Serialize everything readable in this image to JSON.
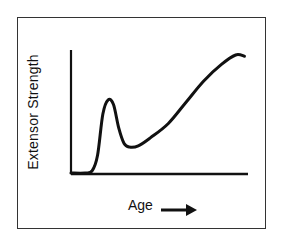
{
  "chart_data": {
    "type": "line",
    "title": "",
    "xlabel": "Age",
    "ylabel": "Extensor Strength",
    "x_arrow": true,
    "grid": false,
    "legend": null,
    "x_ticks": [],
    "y_ticks": [],
    "xlim": [
      0,
      100
    ],
    "ylim": [
      0,
      100
    ],
    "series": [
      {
        "name": "Extensor Strength",
        "x": [
          0,
          8,
          12,
          15,
          18,
          21,
          24,
          27,
          30,
          33,
          38,
          45,
          55,
          65,
          75,
          85,
          93,
          98
        ],
        "y": [
          0,
          0,
          2,
          15,
          50,
          62,
          58,
          38,
          25,
          22,
          23,
          30,
          42,
          60,
          78,
          92,
          100,
          99
        ]
      }
    ],
    "annotations": [
      "Age →"
    ],
    "colors": {
      "line": "#111111",
      "frame": "#333333",
      "background": "#ffffff"
    }
  },
  "labels": {
    "y_axis": "Extensor Strength",
    "x_axis": "Age"
  }
}
